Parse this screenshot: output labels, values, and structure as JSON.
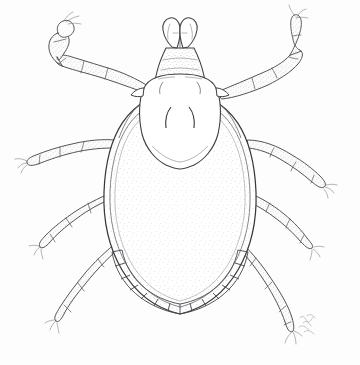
{
  "image": {
    "title": "Tick dorsal view line illustration",
    "subject": "tick",
    "view": "dorsal",
    "style": "pen-and-ink stipple scientific illustration",
    "background_color": "#fdfdfd",
    "ink_color": "#3a3a3c",
    "stipple_color": "#6a6a70",
    "width": 360,
    "height": 365
  },
  "anatomy": {
    "capitulum_label": "capitulum",
    "palps_label": "palps",
    "basis_capituli_label": "basis capituli",
    "scutum_label": "scutum",
    "cervical_grooves_label": "cervical grooves",
    "idiosoma_label": "idiosoma",
    "festoons_label": "festoons",
    "legs_label": "legs",
    "claws_label": "claws",
    "leg_count": 8,
    "festoon_count": 11
  },
  "signature": {
    "present": true,
    "text": "",
    "note": "faint cursive artist signature near lower right leg"
  },
  "caption": {
    "alt_text": "Black and white stippled line drawing of a tick seen from above, with eight segmented legs, a pale shield-shaped scutum behind the mouthparts, a finely stippled oval body and a row of festoons along the rear margin."
  }
}
